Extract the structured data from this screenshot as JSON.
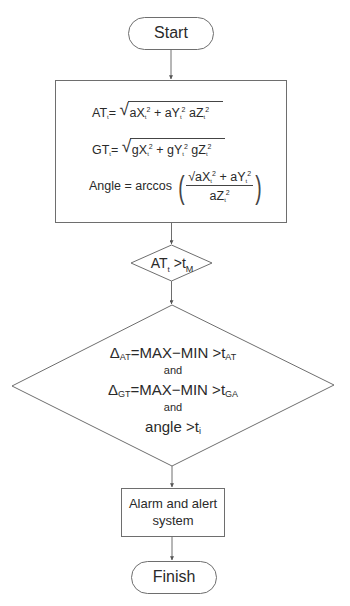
{
  "flowchart": {
    "start": {
      "label": "Start"
    },
    "compute_box": {
      "formula_at": {
        "lhs": "AT",
        "lhs_sub": "t",
        "eq": "=",
        "terms": [
          "aX",
          "+ aY",
          "aZ"
        ],
        "sub": "t",
        "sup": "2"
      },
      "formula_gt": {
        "lhs": "GT",
        "lhs_sub": "t",
        "eq": "=",
        "terms": [
          "gX",
          "+ gY",
          "gZ"
        ],
        "sub": "t",
        "sup": "2"
      },
      "formula_angle": {
        "lhs": "Angle = arccos",
        "numerator_terms": [
          "aX",
          "+ aY"
        ],
        "denominator_term": "aZ",
        "sub": "t",
        "sup": "2"
      }
    },
    "decision_threshold": {
      "lhs": "AT",
      "lhs_sub": "t",
      "op": " >t",
      "rhs_sub": "M"
    },
    "decision_conditions": {
      "line1": {
        "delta": "Δ",
        "delta_sub": "AT",
        "expr": "=MAX−MIN >t",
        "rhs_sub": "AT"
      },
      "and1": "and",
      "line2": {
        "delta": "Δ",
        "delta_sub": "GT",
        "expr": "=MAX−MIN >t",
        "rhs_sub": "GA"
      },
      "and2": "and",
      "line3": {
        "expr": "angle >t",
        "rhs_sub": "i"
      }
    },
    "alarm_box": {
      "line1": "Alarm and alert",
      "line2": "system"
    },
    "finish": {
      "label": "Finish"
    }
  },
  "colors": {
    "stroke": "#6e6e6e",
    "text": "#2a2a2a",
    "background": "#ffffff"
  }
}
